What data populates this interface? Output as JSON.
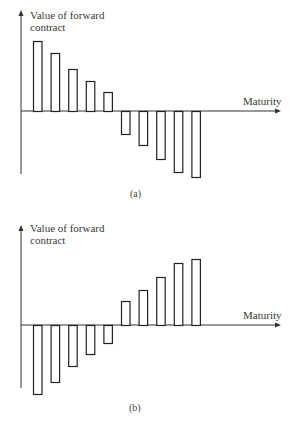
{
  "chart_data": [
    {
      "type": "bar",
      "panel_label": "(a)",
      "ylabel": "Value of forward contract",
      "xlabel": "Maturity",
      "categories": [
        1,
        2,
        3,
        4,
        5,
        6,
        7,
        8,
        9,
        10
      ],
      "values": [
        70,
        58,
        42,
        30,
        19,
        -23,
        -34,
        -48,
        -61,
        -66
      ],
      "grid": false,
      "ticks": false,
      "note": "Values are relative bar heights (unitless); first five positive and decreasing, last five negative and increasing in magnitude"
    },
    {
      "type": "bar",
      "panel_label": "(b)",
      "ylabel": "Value of forward contract",
      "xlabel": "Maturity",
      "categories": [
        1,
        2,
        3,
        4,
        5,
        6,
        7,
        8,
        9,
        10
      ],
      "values": [
        -69,
        -57,
        -41,
        -29,
        -18,
        24,
        35,
        48,
        62,
        66
      ],
      "grid": false,
      "ticks": false,
      "note": "Mirror image of (a): first five negative decreasing in magnitude, last five positive and increasing"
    }
  ],
  "panels": [
    {
      "ylabel_line1": "Value of forward",
      "ylabel_line2": "contract",
      "xlabel": "Maturity",
      "caption": "(a)"
    },
    {
      "ylabel_line1": "Value of forward",
      "ylabel_line2": "contract",
      "xlabel": "Maturity",
      "caption": "(b)"
    }
  ],
  "colors": {
    "axis": "#333333",
    "bar_stroke": "#222222",
    "bar_fill": "#ffffff"
  }
}
